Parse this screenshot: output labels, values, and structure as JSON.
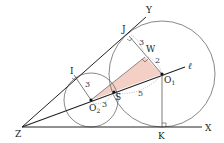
{
  "diagram": {
    "colors": {
      "line": "#222222",
      "circle": "#555555",
      "shade": "#f4cfc6",
      "dashed": "#777777"
    },
    "points": {
      "Z": {
        "label": "Z",
        "x": 22,
        "y": 127
      },
      "X": {
        "label": "X",
        "x": 202,
        "y": 127
      },
      "Y": {
        "label": "Y",
        "x": 146,
        "y": 17
      },
      "J": {
        "label": "J",
        "x": 129,
        "y": 36
      },
      "W": {
        "label": "W",
        "x": 145,
        "y": 57
      },
      "O1": {
        "label": "O",
        "sub": "1",
        "x": 162,
        "y": 74
      },
      "O2": {
        "label": "O",
        "sub": "2",
        "x": 91,
        "y": 100
      },
      "S": {
        "label": "S",
        "x": 114,
        "y": 92
      },
      "I": {
        "label": "I",
        "x": 74,
        "y": 75
      },
      "K": {
        "label": "K",
        "x": 162,
        "y": 127
      },
      "l": {
        "label": "ℓ",
        "x": 185,
        "y": 67
      }
    },
    "circles": [
      {
        "name": "small-circle",
        "center": "O2",
        "r": 27
      },
      {
        "name": "large-circle",
        "center": "O1",
        "r": 53
      }
    ],
    "measurements": {
      "JW": "3",
      "WO1": "2",
      "IO2": "3",
      "O2S": "3",
      "SO1": "5"
    }
  }
}
